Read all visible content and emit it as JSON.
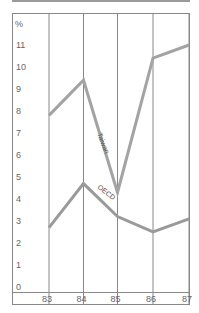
{
  "chart_data": {
    "type": "line",
    "title": "",
    "xlabel": "",
    "ylabel": "%",
    "categories": [
      "83",
      "84",
      "85",
      "86",
      "87"
    ],
    "series": [
      {
        "name": "Taiwan",
        "values": [
          7.8,
          9.4,
          4.3,
          10.4,
          11.0
        ]
      },
      {
        "name": "OECD",
        "values": [
          2.7,
          4.7,
          3.2,
          2.5,
          3.1
        ]
      }
    ],
    "ylim": [
      0,
      11
    ],
    "yticks": [
      "0",
      "1",
      "2",
      "3",
      "4",
      "5",
      "6",
      "7",
      "8",
      "9",
      "10",
      "11"
    ],
    "grid": "vertical gridlines at each year",
    "legend": "inline labels along lines"
  },
  "labels": {
    "y_unit": "%",
    "series_taiwan": "Taiwan",
    "series_oecd": "OECD"
  },
  "colors": {
    "line": "#a0a0a0",
    "frame": "#888888"
  }
}
